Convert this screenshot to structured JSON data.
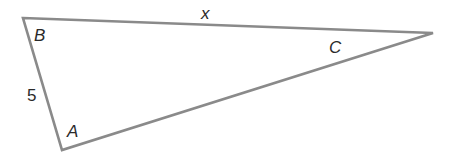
{
  "diagram": {
    "type": "triangle",
    "stroke_color": "#8a8a8a",
    "vertices": [
      {
        "id": "B",
        "label": "B",
        "x": 23,
        "y": 18
      },
      {
        "id": "C",
        "label": "C",
        "x": 433,
        "y": 33
      },
      {
        "id": "A",
        "label": "A",
        "x": 62,
        "y": 150
      }
    ],
    "side_labels": {
      "BC": "x",
      "AB": "5"
    }
  }
}
